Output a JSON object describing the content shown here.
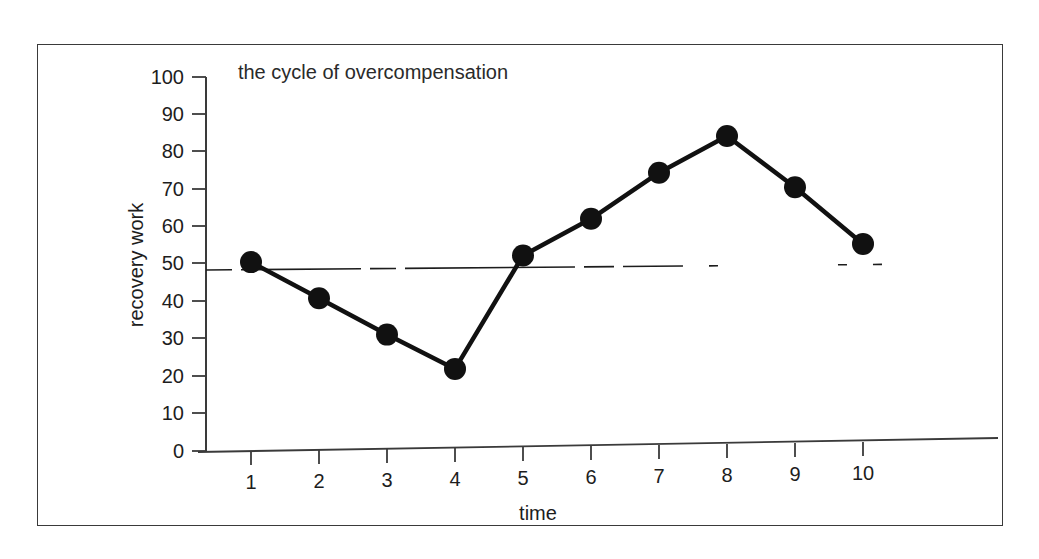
{
  "chart_data": {
    "type": "line",
    "title": "the cycle of overcompensation",
    "xlabel": "time",
    "ylabel": "recovery work",
    "x": [
      1,
      2,
      3,
      4,
      5,
      6,
      7,
      8,
      9,
      10
    ],
    "values": [
      50.5,
      40.5,
      30.5,
      21,
      51,
      60.5,
      72.5,
      82,
      68,
      52.5
    ],
    "xlim": [
      0,
      10.6
    ],
    "ylim": [
      0,
      100
    ],
    "xticks": [
      "1",
      "2",
      "3",
      "4",
      "5",
      "6",
      "7",
      "8",
      "9",
      "10"
    ],
    "yticks": [
      "0",
      "10",
      "20",
      "30",
      "40",
      "50",
      "60",
      "70",
      "80",
      "90",
      "100"
    ],
    "grid": false,
    "legend": "none",
    "series": [
      {
        "name": "recovery work",
        "values": [
          50.5,
          40.5,
          30.5,
          21,
          51,
          60.5,
          72.5,
          82,
          68,
          52.5
        ],
        "marker": "filled-circle",
        "color": "#111111"
      }
    ],
    "annotations": [
      {
        "name": "baseline",
        "type": "horizontal-dashed-line",
        "value": 51,
        "label": "",
        "color": "#1d1d1d"
      }
    ]
  },
  "colors": {
    "line": "#111111",
    "marker": "#111111",
    "axis": "#3a3a3a",
    "frame": "#3a3a3a",
    "text": "#1d1d1d",
    "background": "#ffffff"
  }
}
